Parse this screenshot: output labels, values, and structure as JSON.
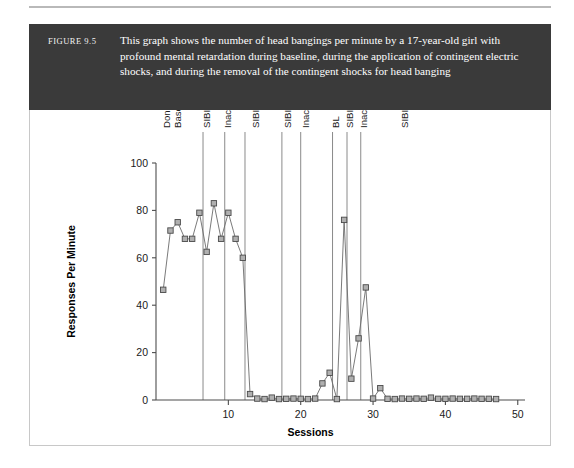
{
  "figure": {
    "number": "FIGURE 9.5",
    "caption": "This graph shows the number of head bangings per minute by a 17-year-old girl with profound mental retardation during baseline, during the application of contingent electric shocks, and during the removal of the contingent shocks for head banging",
    "band_color": "#3a3a3a",
    "frame_color": "#c8c8c8"
  },
  "chart_data": {
    "type": "line",
    "title": "",
    "xlabel": "Sessions",
    "ylabel": "Responses Per Minute",
    "xlim": [
      0,
      51
    ],
    "ylim": [
      0,
      100
    ],
    "xticks": [
      10,
      20,
      30,
      40,
      50
    ],
    "yticks": [
      0,
      20,
      40,
      60,
      80,
      100
    ],
    "grid": false,
    "legend": "none",
    "marker": "open-square",
    "series": [
      {
        "name": "Head bangings per minute",
        "x": [
          1,
          2,
          3,
          4,
          5,
          6,
          7,
          8,
          9,
          10,
          11,
          12,
          13,
          14,
          15,
          16,
          17,
          18,
          19,
          20,
          21,
          22,
          23,
          24,
          25,
          26,
          27,
          28,
          29,
          30,
          31,
          32,
          33,
          34,
          35,
          36,
          37,
          38,
          39,
          40,
          41,
          42,
          43,
          44,
          45,
          46,
          47
        ],
        "values": [
          46.5,
          71.5,
          75,
          68,
          68,
          79,
          62.5,
          83,
          68,
          79,
          68,
          60,
          2.5,
          0.6,
          0.4,
          1.0,
          0.4,
          0.5,
          0.6,
          0.5,
          0.4,
          0.6,
          7,
          11.5,
          0.4,
          76,
          9,
          26,
          47.5,
          0.6,
          5,
          0.5,
          0.4,
          0.6,
          0.5,
          0.6,
          0.5,
          1.0,
          0.5,
          0.5,
          0.6,
          0.5,
          0.5,
          0.6,
          0.5,
          0.5,
          0.4
        ]
      }
    ],
    "phases": [
      {
        "label": "Donna\nBaseline",
        "label_x": 2.0,
        "divider_x": null
      },
      {
        "label": "SIBIS",
        "label_x": 7.4,
        "divider_x": 6.5
      },
      {
        "label": "Inactive",
        "label_x": 10.3,
        "divider_x": 9.5
      },
      {
        "label": "SIBIS",
        "label_x": 14.2,
        "divider_x": 12.3
      },
      {
        "label": "SIBIS",
        "label_x": 18.6,
        "divider_x": 17.4
      },
      {
        "label": "Inactive",
        "label_x": 21.2,
        "divider_x": 20.0
      },
      {
        "label": "BL",
        "label_x": 25.3,
        "divider_x": 24.4
      },
      {
        "label": "SIBIS",
        "label_x": 27.2,
        "divider_x": 26.4
      },
      {
        "label": "Inactive",
        "label_x": 29.1,
        "divider_x": 28.3
      },
      {
        "label": "SIBIS",
        "label_x": 34.8,
        "divider_x": null
      }
    ],
    "phase_divider_color": "#8a8a8a",
    "marker_fill": "#b0b0b0",
    "marker_stroke": "#4a4a4a",
    "line_color": "#6b6b6b"
  }
}
